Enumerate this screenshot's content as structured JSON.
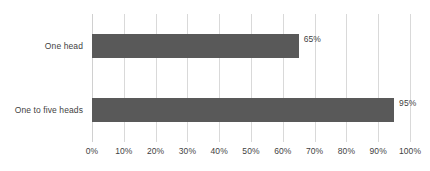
{
  "chart_data": {
    "type": "bar",
    "orientation": "horizontal",
    "title": "",
    "subtitle": "",
    "xlabel": "",
    "ylabel": "",
    "categories": [
      "One head",
      "One to five heads"
    ],
    "values": [
      65,
      95
    ],
    "value_labels": [
      "65%",
      "95%"
    ],
    "xlim": [
      0,
      100
    ],
    "xticks": [
      0,
      10,
      20,
      30,
      40,
      50,
      60,
      70,
      80,
      90,
      100
    ],
    "xtick_labels": [
      "0%",
      "10%",
      "20%",
      "30%",
      "40%",
      "50%",
      "60%",
      "70%",
      "80%",
      "90%",
      "100%"
    ],
    "grid": "vertical",
    "legend": "none",
    "series": [
      {
        "name": "",
        "values": [
          65,
          95
        ]
      }
    ],
    "colors": {
      "bar_fill": "#595959",
      "gridline": "#d9d9d9",
      "axis_line": "#d0d0d0",
      "text": "#3f3f3f",
      "background": "#ffffff"
    }
  }
}
